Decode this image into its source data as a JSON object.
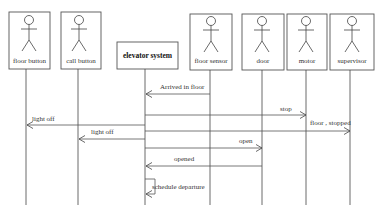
{
  "diagram": {
    "type": "sequence",
    "participants": [
      {
        "id": "floor_button",
        "label": "floor button",
        "kind": "actor"
      },
      {
        "id": "call_button",
        "label": "call button",
        "kind": "actor"
      },
      {
        "id": "elevator_system",
        "label": "elevator system",
        "kind": "object"
      },
      {
        "id": "floor_sensor",
        "label": "floor sensor",
        "kind": "actor"
      },
      {
        "id": "door",
        "label": "door",
        "kind": "actor"
      },
      {
        "id": "motor",
        "label": "motor",
        "kind": "actor"
      },
      {
        "id": "supervisor",
        "label": "supervisor",
        "kind": "actor"
      }
    ],
    "messages": [
      {
        "from": "floor_sensor",
        "to": "elevator_system",
        "label": "Arrived in floor"
      },
      {
        "from": "elevator_system",
        "to": "motor",
        "label": "stop"
      },
      {
        "from": "elevator_system",
        "to": "floor_button",
        "label": "light off"
      },
      {
        "from": "elevator_system",
        "to": "supervisor",
        "label": "floor , stopped"
      },
      {
        "from": "elevator_system",
        "to": "call_button",
        "label": "light off"
      },
      {
        "from": "elevator_system",
        "to": "door",
        "label": "open"
      },
      {
        "from": "door",
        "to": "elevator_system",
        "label": "opened"
      },
      {
        "from": "elevator_system",
        "to": "elevator_system",
        "label": "schedule departure"
      }
    ]
  }
}
